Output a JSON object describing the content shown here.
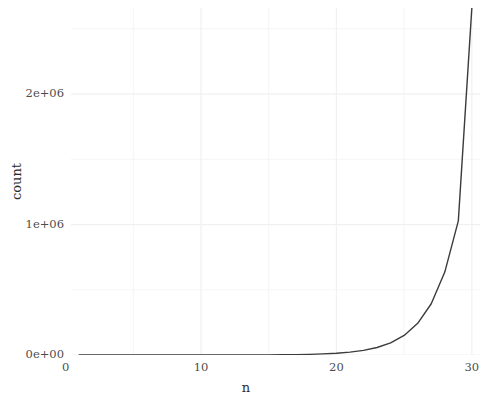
{
  "chart_data": {
    "type": "line",
    "title": "",
    "subtitle": "",
    "xlabel": "n",
    "ylabel": "count",
    "xlim": [
      0.4,
      30.6
    ],
    "ylim": [
      0,
      2660000
    ],
    "grid": true,
    "legend": null,
    "legend_position": "none",
    "x_ticks": [
      0,
      10,
      20,
      30
    ],
    "x_tick_labels": [
      "0",
      "10",
      "20",
      "30"
    ],
    "x_minor_ticks": [
      5,
      15,
      25
    ],
    "y_ticks": [
      0,
      1000000,
      2000000
    ],
    "y_tick_labels": [
      "0e+00",
      "1e+06",
      "2e+06"
    ],
    "y_minor_ticks": [
      500000,
      1500000,
      2500000
    ],
    "line_color": "#3b3b3b",
    "line_width": 1.4,
    "panel_background": "#ffffff",
    "grid_color": "#f2f0f2",
    "series": [
      {
        "name": "count",
        "x": [
          1,
          2,
          3,
          4,
          5,
          6,
          7,
          8,
          9,
          10,
          11,
          12,
          13,
          14,
          15,
          16,
          17,
          18,
          19,
          20,
          21,
          22,
          23,
          24,
          25,
          26,
          27,
          28,
          29,
          30
        ],
        "values": [
          1,
          1,
          3,
          5,
          9,
          15,
          25,
          41,
          67,
          109,
          177,
          287,
          465,
          753,
          1219,
          1973,
          3193,
          5167,
          8361,
          13529,
          21891,
          35421,
          57313,
          92735,
          150049,
          242785,
          392835,
          635621,
          1028457,
          2663885
        ]
      }
    ],
    "annotations": []
  },
  "axis": {
    "x_title": "n",
    "y_title": "count"
  }
}
